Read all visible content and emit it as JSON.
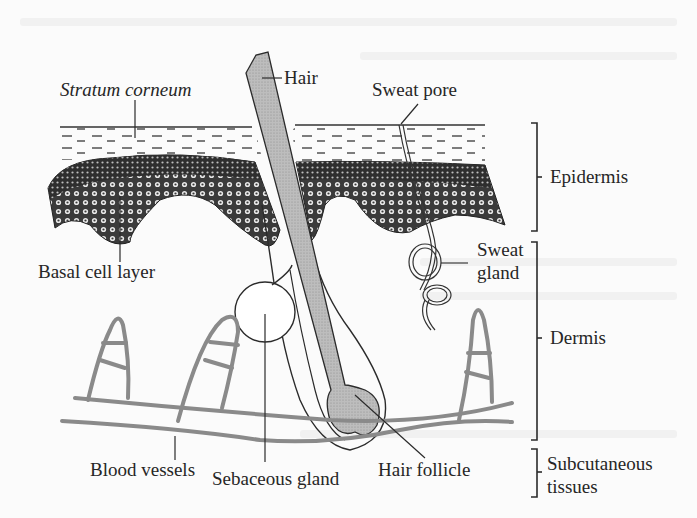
{
  "diagram": {
    "labels": {
      "stratum_corneum": "Stratum corneum",
      "hair": "Hair",
      "sweat_pore": "Sweat pore",
      "epidermis": "Epidermis",
      "basal_cell_layer": "Basal cell layer",
      "sweat_gland_1": "Sweat",
      "sweat_gland_2": "gland",
      "dermis": "Dermis",
      "blood_vessels": "Blood vessels",
      "sebaceous_gland": "Sebaceous gland",
      "hair_follicle": "Hair follicle",
      "subcutaneous_1": "Subcutaneous",
      "subcutaneous_2": "tissues"
    },
    "layers": [
      "Epidermis",
      "Dermis",
      "Subcutaneous tissues"
    ],
    "structures": [
      "Stratum corneum",
      "Basal cell layer",
      "Hair",
      "Hair follicle",
      "Sebaceous gland",
      "Sweat pore",
      "Sweat gland",
      "Blood vessels"
    ],
    "colors": {
      "ink": "#2b2b2b",
      "hair_fill": "#b9b9b9",
      "vessel": "#8a8a8a",
      "background": "#fbfbfb"
    }
  }
}
